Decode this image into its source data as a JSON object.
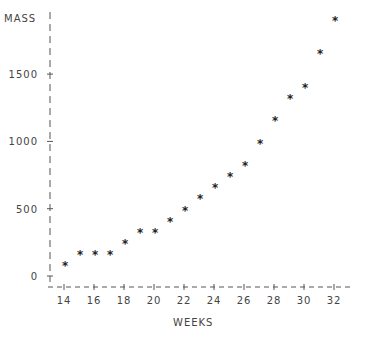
{
  "chart_data": {
    "type": "scatter",
    "title": "",
    "xlabel": "WEEKS",
    "ylabel": "MASS",
    "marker": "*",
    "x_ticks": [
      14,
      16,
      18,
      20,
      22,
      24,
      26,
      28,
      30,
      32
    ],
    "y_ticks": [
      0,
      500,
      1000,
      1500
    ],
    "xlim": [
      13,
      33
    ],
    "ylim": [
      -80,
      1930
    ],
    "grid": false,
    "legend": null,
    "x": [
      14,
      15,
      16,
      17,
      18,
      19,
      20,
      21,
      22,
      23,
      24,
      25,
      26,
      27,
      28,
      29,
      30,
      31,
      32
    ],
    "y": [
      90,
      170,
      170,
      170,
      250,
      335,
      335,
      415,
      500,
      590,
      670,
      750,
      830,
      995,
      1165,
      1330,
      1410,
      1665,
      1910
    ]
  }
}
